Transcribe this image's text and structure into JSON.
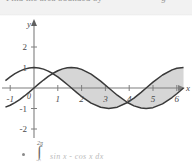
{
  "top_bar": {
    "clipped_text_left": "Find the area bounded by",
    "clipped_text_right": "g"
  },
  "figure": {
    "axis_label_x": "x",
    "axis_label_y": "y",
    "origin_label": "0",
    "x_ticks": [
      "-1",
      "1",
      "2",
      "3",
      "4",
      "5",
      "6"
    ],
    "y_ticks": [
      "2",
      "1",
      "-1",
      "-2"
    ],
    "colors": {
      "curve": "#3a3a3a",
      "axis": "#7a7a7a",
      "shade_fill": "#d4d4d4",
      "tick_text": "#5a5a5a",
      "background": "#ffffff"
    }
  },
  "chart_data": {
    "type": "line",
    "title": "",
    "xlabel": "x",
    "ylabel": "y",
    "xlim": [
      -1.2,
      6.4
    ],
    "ylim": [
      -2.4,
      2.4
    ],
    "xticks": [
      -1,
      0,
      1,
      2,
      3,
      4,
      5,
      6
    ],
    "yticks": [
      -2,
      -1,
      0,
      1,
      2
    ],
    "grid": false,
    "legend": "none",
    "shaded_region": {
      "between": [
        "sin(x)",
        "cos(x)"
      ],
      "x_from": 0.785,
      "x_to": 6.283,
      "fill": "#d4d4d4"
    },
    "series": [
      {
        "name": "sin(x)",
        "expression": "y = sin x",
        "x": [
          -1.2,
          -1.0,
          -0.8,
          -0.6,
          -0.4,
          -0.2,
          0.0,
          0.2,
          0.4,
          0.6,
          0.785,
          1.0,
          1.2,
          1.4,
          1.571,
          1.8,
          2.0,
          2.4,
          2.8,
          3.142,
          3.5,
          3.927,
          4.2,
          4.5,
          4.712,
          5.0,
          5.4,
          5.8,
          6.0,
          6.283
        ],
        "y": [
          -0.932,
          -0.841,
          -0.717,
          -0.565,
          -0.389,
          -0.199,
          0.0,
          0.199,
          0.389,
          0.565,
          0.707,
          0.841,
          0.932,
          0.985,
          1.0,
          0.974,
          0.909,
          0.675,
          0.335,
          0.0,
          -0.351,
          -0.707,
          -0.872,
          -0.978,
          -1.0,
          -0.959,
          -0.773,
          -0.465,
          -0.279,
          0.0
        ]
      },
      {
        "name": "cos(x)",
        "expression": "y = cos x",
        "x": [
          -1.2,
          -1.0,
          -0.8,
          -0.6,
          -0.4,
          -0.2,
          0.0,
          0.2,
          0.4,
          0.6,
          0.785,
          1.0,
          1.2,
          1.4,
          1.571,
          1.8,
          2.0,
          2.4,
          2.8,
          3.142,
          3.5,
          3.927,
          4.2,
          4.5,
          4.712,
          5.0,
          5.4,
          5.8,
          6.0,
          6.283
        ],
        "y": [
          0.362,
          0.54,
          0.697,
          0.825,
          0.921,
          0.98,
          1.0,
          0.98,
          0.921,
          0.825,
          0.707,
          0.54,
          0.362,
          0.17,
          0.0,
          -0.227,
          -0.416,
          -0.737,
          -0.942,
          -1.0,
          -0.936,
          -0.707,
          -0.49,
          -0.211,
          0.0,
          0.284,
          0.635,
          0.886,
          0.96,
          1.0
        ]
      }
    ]
  },
  "formula": {
    "bullet": "•",
    "integral_sign": "∫",
    "upper_limit": "2π",
    "lower_limit": "0",
    "integrand": "sin x - cos x  dx"
  }
}
